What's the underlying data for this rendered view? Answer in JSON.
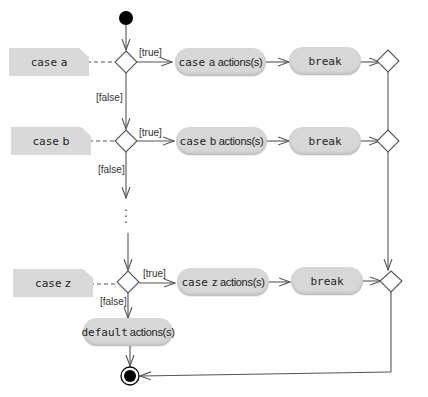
{
  "diagram": {
    "type": "uml-activity-diagram",
    "notes": [
      {
        "keyword": "case",
        "value": "a"
      },
      {
        "keyword": "case",
        "value": "b"
      },
      {
        "keyword": "case",
        "value": "z"
      }
    ],
    "actions": [
      {
        "keyword": "case",
        "text": "a actions(s)"
      },
      {
        "keyword": "case",
        "text": "b actions(s)"
      },
      {
        "keyword": "case",
        "text": "z actions(s)"
      }
    ],
    "breaks": [
      {
        "keyword": "break"
      },
      {
        "keyword": "break"
      },
      {
        "keyword": "break"
      }
    ],
    "default_action": {
      "keyword": "default",
      "text": "actions(s)"
    },
    "guards": {
      "true": "[true]",
      "false": "[false]"
    },
    "ellipsis": "⋮",
    "colors": {
      "node_fill": "#d7d7d7",
      "note_fill": "#d9d9d9",
      "line": "#555555",
      "initial_node": "#000000"
    }
  }
}
